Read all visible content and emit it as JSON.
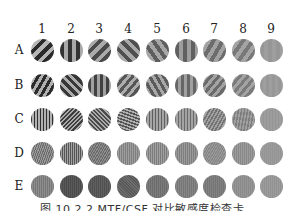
{
  "figure": {
    "column_labels": [
      "1",
      "2",
      "3",
      "4",
      "5",
      "6",
      "7",
      "8",
      "9"
    ],
    "row_labels": [
      "A",
      "B",
      "C",
      "D",
      "E"
    ],
    "caption": "图 10.2.2  MTF/CSF 对比敏感度检查卡"
  },
  "layout": {
    "col_x": [
      42,
      71,
      99,
      128,
      157,
      186,
      214,
      243,
      271
    ],
    "row_y": [
      50,
      85,
      119,
      153,
      186
    ]
  },
  "patches": [
    [
      {
        "angle": 45,
        "period": 8,
        "dark": "#2a2a2a",
        "light": "#b5b5b5"
      },
      {
        "angle": 0,
        "period": 8,
        "dark": "#333333",
        "light": "#a9a9a9"
      },
      {
        "angle": 45,
        "period": 8,
        "dark": "#4a4a4a",
        "light": "#aaaaaa"
      },
      {
        "angle": -45,
        "period": 8,
        "dark": "#4f4f4f",
        "light": "#a8a8a8"
      },
      {
        "angle": -35,
        "period": 8,
        "dark": "#5e5e5e",
        "light": "#a6a6a6"
      },
      {
        "angle": 0,
        "period": 8,
        "dark": "#606060",
        "light": "#9d9d9d"
      },
      {
        "angle": 30,
        "period": 8,
        "dark": "#6c6c6c",
        "light": "#a2a2a2"
      },
      {
        "angle": 35,
        "period": 8,
        "dark": "#787878",
        "light": "#a4a4a4"
      },
      {
        "angle": 0,
        "period": 8,
        "dark": "#969696",
        "light": "#9e9e9e"
      }
    ],
    [
      {
        "angle": 30,
        "period": 6,
        "dark": "#2b2b2b",
        "light": "#b0b0b0"
      },
      {
        "angle": -45,
        "period": 6,
        "dark": "#373737",
        "light": "#acacac"
      },
      {
        "angle": 0,
        "period": 6,
        "dark": "#404040",
        "light": "#a0a0a0"
      },
      {
        "angle": 40,
        "period": 6,
        "dark": "#555555",
        "light": "#acacac"
      },
      {
        "angle": -30,
        "period": 6,
        "dark": "#5b5b5b",
        "light": "#a8a8a8"
      },
      {
        "angle": 0,
        "period": 6,
        "dark": "#666666",
        "light": "#a0a0a0"
      },
      {
        "angle": 40,
        "period": 6,
        "dark": "#6a6a6a",
        "light": "#a3a3a3"
      },
      {
        "angle": 40,
        "period": 6,
        "dark": "#7a7a7a",
        "light": "#a3a3a3"
      },
      {
        "angle": 0,
        "period": 6,
        "dark": "#979797",
        "light": "#9e9e9e"
      }
    ],
    [
      {
        "angle": 0,
        "period": 3,
        "dark": "#303030",
        "light": "#b2b2b2"
      },
      {
        "angle": 45,
        "period": 3,
        "dark": "#3e3e3e",
        "light": "#ababab"
      },
      {
        "angle": -45,
        "period": 3,
        "dark": "#4a4a4a",
        "light": "#acacac"
      },
      {
        "angle": -70,
        "period": 3,
        "dark": "#555555",
        "light": "#b0b0b0"
      },
      {
        "angle": 0,
        "period": 3,
        "dark": "#5f5f5f",
        "light": "#a5a5a5"
      },
      {
        "angle": 0,
        "period": 3,
        "dark": "#6a6a6a",
        "light": "#a3a3a3"
      },
      {
        "angle": 30,
        "period": 3,
        "dark": "#727272",
        "light": "#a2a2a2"
      },
      {
        "angle": 10,
        "period": 3,
        "dark": "#7e7e7e",
        "light": "#a0a0a0"
      },
      {
        "angle": 0,
        "period": 3,
        "dark": "#959595",
        "light": "#9d9d9d"
      }
    ],
    [
      {
        "angle": 20,
        "period": 2,
        "dark": "#6c6c6c",
        "light": "#9a9a9a"
      },
      {
        "angle": 0,
        "period": 2,
        "dark": "#555555",
        "light": "#a2a2a2"
      },
      {
        "angle": 30,
        "period": 2,
        "dark": "#6a6a6a",
        "light": "#8e8e8e"
      },
      {
        "angle": 0,
        "period": 2,
        "dark": "#7e7e7e",
        "light": "#9e9e9e"
      },
      {
        "angle": 0,
        "period": 2,
        "dark": "#7c7c7c",
        "light": "#a0a0a0"
      },
      {
        "angle": 0,
        "period": 2,
        "dark": "#7e7e7e",
        "light": "#9a9a9a"
      },
      {
        "angle": 30,
        "period": 2,
        "dark": "#858585",
        "light": "#9a9a9a"
      },
      {
        "angle": 0,
        "period": 2,
        "dark": "#888888",
        "light": "#9c9c9c"
      },
      {
        "angle": 0,
        "period": 2,
        "dark": "#949494",
        "light": "#9c9c9c"
      }
    ],
    [
      {
        "angle": 0,
        "period": 2,
        "dark": "#777777",
        "light": "#8d8d8d"
      },
      {
        "angle": 0,
        "period": 2,
        "dark": "#4a4a4a",
        "light": "#5a5a5a"
      },
      {
        "angle": 0,
        "period": 2,
        "dark": "#505050",
        "light": "#606060"
      },
      {
        "angle": -45,
        "period": 2,
        "dark": "#585858",
        "light": "#6e6e6e"
      },
      {
        "angle": 0,
        "period": 2,
        "dark": "#6c6c6c",
        "light": "#7c7c7c"
      },
      {
        "angle": 0,
        "period": 2,
        "dark": "#767676",
        "light": "#868686"
      },
      {
        "angle": 0,
        "period": 2,
        "dark": "#747474",
        "light": "#828282"
      },
      {
        "angle": 0,
        "period": 2,
        "dark": "#8a8a8a",
        "light": "#969696"
      },
      {
        "angle": 0,
        "period": 2,
        "dark": "#929292",
        "light": "#9c9c9c"
      }
    ]
  ]
}
